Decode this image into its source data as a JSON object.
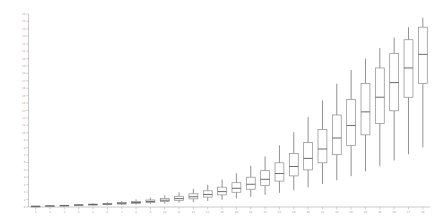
{
  "chart_data": {
    "type": "box",
    "title": "",
    "xlabel": "",
    "ylabel": "",
    "grid": false,
    "legend": null,
    "xlim": [
      0,
      29
    ],
    "ylim": [
      0,
      27
    ],
    "ytick_labels": [
      "0",
      "1",
      "2",
      "3",
      "4",
      "5",
      "6",
      "7",
      "8",
      "9",
      "10",
      "11",
      "12",
      "13",
      "14",
      "15",
      "16",
      "17",
      "18",
      "19",
      "20",
      "21",
      "22",
      "23",
      "24",
      "25",
      "26"
    ],
    "ytick_values": [
      0,
      1,
      2,
      3,
      4,
      5,
      6,
      7,
      8,
      9,
      10,
      11,
      12,
      13,
      14,
      15,
      16,
      17,
      18,
      19,
      20,
      21,
      22,
      23,
      24,
      25,
      26
    ],
    "categories": [
      "1",
      "2",
      "3",
      "4",
      "5",
      "6",
      "7",
      "8",
      "9",
      "10",
      "11",
      "12",
      "13",
      "14",
      "15",
      "16",
      "17",
      "18",
      "19",
      "20",
      "21",
      "22",
      "23",
      "24",
      "25",
      "26",
      "27",
      "28"
    ],
    "boxes": [
      {
        "category": "1",
        "whisker_low": 0.1,
        "q1": 0.12,
        "median": 0.14,
        "q3": 0.16,
        "whisker_high": 0.18
      },
      {
        "category": "2",
        "whisker_low": 0.14,
        "q1": 0.18,
        "median": 0.2,
        "q3": 0.24,
        "whisker_high": 0.28
      },
      {
        "category": "3",
        "whisker_low": 0.18,
        "q1": 0.24,
        "median": 0.28,
        "q3": 0.32,
        "whisker_high": 0.4
      },
      {
        "category": "4",
        "whisker_low": 0.22,
        "q1": 0.3,
        "median": 0.36,
        "q3": 0.44,
        "whisker_high": 0.54
      },
      {
        "category": "5",
        "whisker_low": 0.26,
        "q1": 0.38,
        "median": 0.46,
        "q3": 0.56,
        "whisker_high": 0.7
      },
      {
        "category": "6",
        "whisker_low": 0.32,
        "q1": 0.46,
        "median": 0.56,
        "q3": 0.7,
        "whisker_high": 0.9
      },
      {
        "category": "7",
        "whisker_low": 0.38,
        "q1": 0.56,
        "median": 0.7,
        "q3": 0.88,
        "whisker_high": 1.15
      },
      {
        "category": "8",
        "whisker_low": 0.46,
        "q1": 0.7,
        "median": 0.86,
        "q3": 1.08,
        "whisker_high": 1.45
      },
      {
        "category": "9",
        "whisker_low": 0.55,
        "q1": 0.86,
        "median": 1.06,
        "q3": 1.34,
        "whisker_high": 1.8
      },
      {
        "category": "10",
        "whisker_low": 0.66,
        "q1": 1.04,
        "median": 1.3,
        "q3": 1.66,
        "whisker_high": 2.25
      },
      {
        "category": "11",
        "whisker_low": 0.8,
        "q1": 1.28,
        "median": 1.6,
        "q3": 2.05,
        "whisker_high": 2.8
      },
      {
        "category": "12",
        "whisker_low": 0.95,
        "q1": 1.56,
        "median": 1.96,
        "q3": 2.52,
        "whisker_high": 3.45
      },
      {
        "category": "13",
        "whisker_low": 1.15,
        "q1": 1.9,
        "median": 2.4,
        "q3": 3.1,
        "whisker_high": 4.25
      },
      {
        "category": "14",
        "whisker_low": 1.38,
        "q1": 2.32,
        "median": 2.94,
        "q3": 3.8,
        "whisker_high": 5.25
      },
      {
        "category": "15",
        "whisker_low": 1.65,
        "q1": 2.82,
        "median": 3.58,
        "q3": 4.65,
        "whisker_high": 6.45
      },
      {
        "category": "16",
        "whisker_low": 1.95,
        "q1": 3.4,
        "median": 4.35,
        "q3": 5.7,
        "whisker_high": 7.9
      },
      {
        "category": "17",
        "whisker_low": 2.3,
        "q1": 4.1,
        "median": 5.3,
        "q3": 6.95,
        "whisker_high": 9.7
      },
      {
        "category": "18",
        "whisker_low": 2.7,
        "q1": 4.95,
        "median": 6.4,
        "q3": 8.45,
        "whisker_high": 11.8
      },
      {
        "category": "19",
        "whisker_low": 3.2,
        "q1": 5.95,
        "median": 7.75,
        "q3": 10.25,
        "whisker_high": 14.3
      },
      {
        "category": "20",
        "whisker_low": 3.75,
        "q1": 7.1,
        "median": 9.3,
        "q3": 12.35,
        "whisker_high": 17.2
      },
      {
        "category": "21",
        "whisker_low": 4.4,
        "q1": 8.45,
        "median": 11.1,
        "q3": 14.8,
        "whisker_high": 20.4
      },
      {
        "category": "22",
        "whisker_low": 5.1,
        "q1": 10.0,
        "median": 13.2,
        "q3": 17.6,
        "whisker_high": 23.6
      },
      {
        "category": "23",
        "whisker_low": 5.9,
        "q1": 11.8,
        "median": 15.6,
        "q3": 20.6,
        "whisker_high": 26.2
      },
      {
        "category": "24",
        "whisker_low": 6.8,
        "q1": 13.8,
        "median": 18.2,
        "q3": 23.6,
        "whisker_high": 28.4
      },
      {
        "category": "25",
        "whisker_low": 7.8,
        "q1": 16.0,
        "median": 21.0,
        "q3": 26.6,
        "whisker_high": 30.4
      },
      {
        "category": "26",
        "whisker_low": 8.9,
        "q1": 18.4,
        "median": 23.8,
        "q3": 29.4,
        "whisker_high": 32.4
      },
      {
        "category": "27",
        "whisker_low": 10.1,
        "q1": 21.0,
        "median": 26.6,
        "q3": 32.0,
        "whisker_high": 34.4
      },
      {
        "category": "28",
        "whisker_low": 11.4,
        "q1": 23.6,
        "median": 29.2,
        "q3": 34.4,
        "whisker_high": 36.2
      }
    ]
  }
}
